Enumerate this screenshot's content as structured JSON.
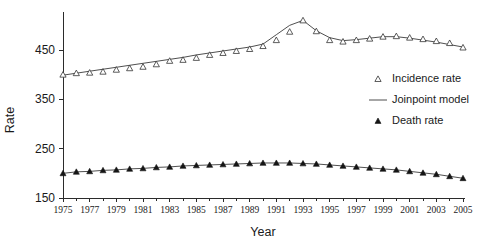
{
  "chart_data": {
    "type": "line",
    "title": "",
    "xlabel": "Year",
    "ylabel": "Rate",
    "xlim": [
      1975,
      2005
    ],
    "ylim": [
      150,
      510
    ],
    "grid": false,
    "legend_position": "right",
    "x": [
      1975,
      1976,
      1977,
      1978,
      1979,
      1980,
      1981,
      1982,
      1983,
      1984,
      1985,
      1986,
      1987,
      1988,
      1989,
      1990,
      1991,
      1992,
      1993,
      1994,
      1995,
      1996,
      1997,
      1998,
      1999,
      2000,
      2001,
      2002,
      2003,
      2004,
      2005
    ],
    "xticks": [
      1975,
      1977,
      1979,
      1981,
      1983,
      1985,
      1987,
      1989,
      1991,
      1993,
      1995,
      1997,
      1999,
      2001,
      2003,
      2005
    ],
    "xtick_labels": [
      "1975",
      "1977",
      "1979",
      "1981",
      "1983",
      "1985",
      "1987",
      "1989",
      "1991",
      "1993",
      "1995",
      "1997",
      "1999",
      "2001",
      "2003",
      "2005"
    ],
    "yticks": [
      150,
      250,
      350,
      450
    ],
    "ytick_labels": [
      "150",
      "250",
      "350",
      "450"
    ],
    "series": [
      {
        "name": "Incidence rate",
        "marker": "open-triangle",
        "values": [
          400,
          403,
          404,
          406,
          410,
          413,
          416,
          421,
          428,
          430,
          434,
          440,
          444,
          448,
          452,
          458,
          470,
          487,
          510,
          488,
          470,
          467,
          470,
          473,
          477,
          478,
          475,
          472,
          468,
          464,
          455
        ]
      },
      {
        "name": "Joinpoint model",
        "marker": "line",
        "values": [
          399,
          403,
          407,
          411,
          415,
          419,
          423,
          427,
          431,
          435,
          440,
          444,
          448,
          452,
          456,
          462,
          481,
          500,
          510,
          489,
          475,
          469,
          471,
          474,
          477,
          477,
          474,
          470,
          466,
          461,
          456
        ]
      },
      {
        "name": "Death rate",
        "marker": "filled-triangle",
        "values": [
          200,
          203,
          204,
          206,
          207,
          209,
          210,
          212,
          213,
          215,
          216,
          217,
          218,
          219,
          220,
          221,
          221,
          221,
          220,
          219,
          217,
          215,
          213,
          211,
          209,
          207,
          204,
          201,
          198,
          194,
          190
        ]
      }
    ],
    "legend": [
      {
        "label": "Incidence rate",
        "marker": "open-triangle"
      },
      {
        "label": "Joinpoint model",
        "marker": "line"
      },
      {
        "label": "Death rate",
        "marker": "filled-triangle"
      }
    ]
  }
}
